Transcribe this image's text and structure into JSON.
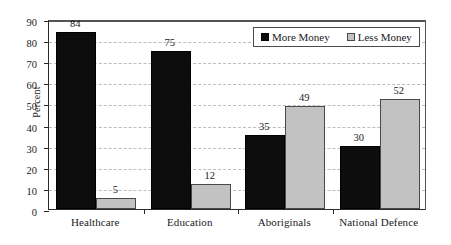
{
  "chart_data": {
    "type": "bar",
    "title": "",
    "xlabel": "",
    "ylabel": "Percent",
    "ylim": [
      0,
      90
    ],
    "ytick_step": 10,
    "yticks": [
      0,
      10,
      20,
      30,
      40,
      50,
      60,
      70,
      80,
      90
    ],
    "grid": true,
    "legend_position": "top-right",
    "categories": [
      "Healthcare",
      "Education",
      "Aboriginals",
      "National Defence"
    ],
    "series": [
      {
        "name": "More Money",
        "color": "#0d0d0d",
        "values": [
          84,
          75,
          35,
          30
        ]
      },
      {
        "name": "Less Money",
        "color": "#c2c2c2",
        "values": [
          5,
          12,
          49,
          52
        ]
      }
    ],
    "data_labels": [
      "84",
      "5",
      "75",
      "12",
      "35",
      "49",
      "30",
      "52"
    ]
  },
  "axis": {
    "y_title": "Percent",
    "y_tick_labels": [
      "90",
      "80",
      "70",
      "60",
      "50",
      "40",
      "30",
      "20",
      "10",
      "0"
    ],
    "x_tick_labels": [
      "Healthcare",
      "Education",
      "Aboriginals",
      "National Defence"
    ]
  },
  "legend": {
    "items": [
      {
        "label": "More Money",
        "swatch": "black-square-swatch"
      },
      {
        "label": "Less Money",
        "swatch": "gray-square-swatch"
      }
    ]
  },
  "bars": [
    {
      "group": "Healthcare",
      "series": "More Money",
      "value": 84,
      "label": "84"
    },
    {
      "group": "Healthcare",
      "series": "Less Money",
      "value": 5,
      "label": "5"
    },
    {
      "group": "Education",
      "series": "More Money",
      "value": 75,
      "label": "75"
    },
    {
      "group": "Education",
      "series": "Less Money",
      "value": 12,
      "label": "12"
    },
    {
      "group": "Aboriginals",
      "series": "More Money",
      "value": 35,
      "label": "35"
    },
    {
      "group": "Aboriginals",
      "series": "Less Money",
      "value": 49,
      "label": "49"
    },
    {
      "group": "National Defence",
      "series": "More Money",
      "value": 30,
      "label": "30"
    },
    {
      "group": "National Defence",
      "series": "Less Money",
      "value": 52,
      "label": "52"
    }
  ]
}
